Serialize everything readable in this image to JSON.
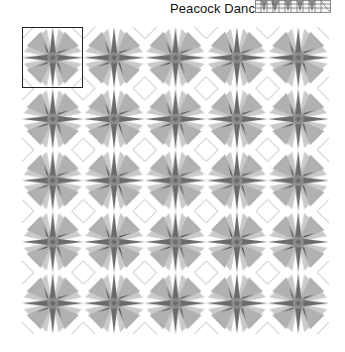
{
  "header": {
    "title": "Peacock Dance",
    "thumbnail_icon": "pattern-thumbnail-icon"
  },
  "pattern": {
    "name": "Peacock Dance",
    "rows": 5,
    "cols": 5,
    "tile_size_px": 61.4,
    "selected_tile": {
      "row": 0,
      "col": 0
    },
    "colors": {
      "background": "#ffffff",
      "spike": "#6e6e6e",
      "wedge": "#9a9a9a",
      "accent_dark": "#3a3a3a",
      "center": "#8a8a8a",
      "diagonal_line": "#9c9c9c",
      "selection_border": "#222222"
    }
  }
}
